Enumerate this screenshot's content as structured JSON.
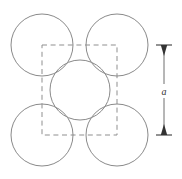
{
  "figure": {
    "name": "bcc-unit-cell-projection",
    "caption": "",
    "background_color": "#ffffff",
    "width": 182,
    "height": 179,
    "atom_stroke_color": "#8a8a8a",
    "cell_stroke_color": "#8f8f8f",
    "dimension_color": "#333333"
  },
  "unit_cell": {
    "name": "dashed-square",
    "x": 42,
    "y": 45,
    "width": 75,
    "height": 90,
    "style": "dashed"
  },
  "atoms": [
    {
      "label": "top-left-atom",
      "cx": 42,
      "cy": 45,
      "r": 31
    },
    {
      "label": "top-right-atom",
      "cx": 117,
      "cy": 45,
      "r": 31
    },
    {
      "label": "center-atom",
      "cx": 80,
      "cy": 90,
      "r": 30
    },
    {
      "label": "bottom-left-atom",
      "cx": 42,
      "cy": 135,
      "r": 31
    },
    {
      "label": "bottom-right-atom",
      "cx": 117,
      "cy": 135,
      "r": 31
    }
  ],
  "dimension": {
    "label": "a",
    "axis": "vertical",
    "x": 164,
    "y_top": 45,
    "y_bottom": 135,
    "tick_half_width": 8,
    "label_x": 164,
    "label_y": 93
  },
  "chart_data": {
    "type": "scatter",
    "title": "",
    "xlabel": "",
    "ylabel": "",
    "annotations": [
      "a"
    ],
    "categories": [
      "top-left-atom",
      "top-right-atom",
      "center-atom",
      "bottom-left-atom",
      "bottom-right-atom"
    ],
    "x": [
      42,
      117,
      80,
      42,
      117
    ],
    "y": [
      45,
      45,
      90,
      135,
      135
    ],
    "radii": [
      31,
      31,
      30,
      31,
      31
    ],
    "legend": [],
    "grid": false
  }
}
